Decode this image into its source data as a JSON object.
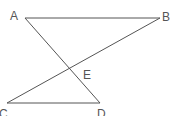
{
  "diagram": {
    "type": "geometry",
    "line_color": "#555555",
    "points": [
      {
        "id": "A",
        "label": "A",
        "x": 25,
        "y": 18,
        "lx": 10,
        "ly": 20
      },
      {
        "id": "B",
        "label": "B",
        "x": 160,
        "y": 18,
        "lx": 162,
        "ly": 21
      },
      {
        "id": "C",
        "label": "C",
        "x": 7,
        "y": 103,
        "lx": -1,
        "ly": 118
      },
      {
        "id": "D",
        "label": "D",
        "x": 100,
        "y": 103,
        "lx": 97,
        "ly": 118
      },
      {
        "id": "E",
        "label": "E",
        "x": 69,
        "y": 69,
        "lx": 83,
        "ly": 79
      }
    ],
    "segments": [
      {
        "from": "A",
        "to": "B"
      },
      {
        "from": "A",
        "to": "D"
      },
      {
        "from": "B",
        "to": "C"
      },
      {
        "from": "C",
        "to": "D"
      }
    ],
    "intersection": {
      "point": "E",
      "of": [
        "AD",
        "BC"
      ]
    }
  }
}
